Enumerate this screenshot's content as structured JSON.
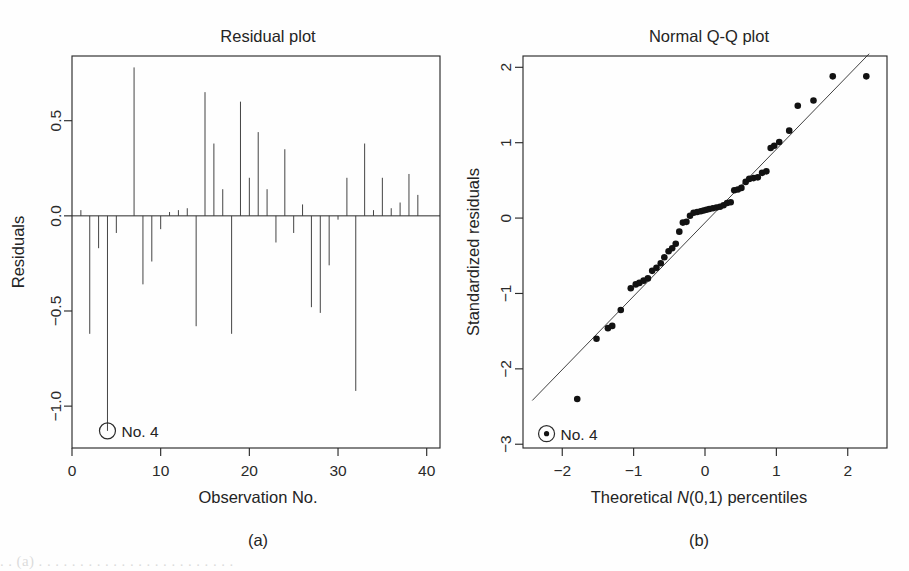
{
  "figure": {
    "panel_a_tag": "(a)",
    "panel_b_tag": "(b)",
    "caption_partial": "     . .   (a)  . . . . . . . . . . . . . . . . . . . . . . . ."
  },
  "chart_data": [
    {
      "id": "residual-plot",
      "type": "bar",
      "title": "Residual plot",
      "xlabel": "Observation No.",
      "ylabel": "Residuals",
      "xlim": [
        0,
        41.5
      ],
      "ylim": [
        -1.22,
        0.84
      ],
      "xticks": [
        0,
        10,
        20,
        30,
        40
      ],
      "xticklabels": [
        "0",
        "10",
        "20",
        "30",
        "40"
      ],
      "yticks": [
        0.5,
        0.0,
        -0.5,
        -1.0
      ],
      "yticklabels": [
        "0.5",
        "0.0",
        "-0.5",
        "-1.0"
      ],
      "grid": false,
      "legend": "none",
      "zero_reference": 0.0,
      "annotation": {
        "text": "No. 4",
        "marker": "open-circle",
        "x": 4,
        "y": -1.13
      },
      "categories": [
        1,
        2,
        3,
        4,
        5,
        6,
        7,
        8,
        9,
        10,
        11,
        12,
        13,
        14,
        15,
        16,
        17,
        18,
        19,
        20,
        21,
        22,
        23,
        24,
        25,
        26,
        27,
        28,
        29,
        30,
        31,
        32,
        33,
        34,
        35,
        36,
        37,
        38,
        39,
        40,
        41
      ],
      "values": [
        0.03,
        -0.62,
        -0.17,
        -1.13,
        -0.09,
        0.0,
        0.78,
        -0.36,
        -0.24,
        -0.07,
        0.02,
        0.03,
        0.04,
        -0.58,
        0.65,
        0.38,
        0.14,
        -0.62,
        0.6,
        0.2,
        0.44,
        0.14,
        -0.14,
        0.35,
        -0.09,
        0.06,
        -0.48,
        -0.51,
        -0.26,
        -0.02,
        0.2,
        -0.92,
        0.38,
        0.03,
        0.2,
        0.04,
        0.07,
        0.22,
        0.11,
        0.0,
        0.0
      ]
    },
    {
      "id": "normal-qq-plot",
      "type": "scatter",
      "title": "Normal Q-Q plot",
      "xlabel": "Theoretical N(0,1) percentiles",
      "xlabel_italic_part": "N",
      "ylabel": "Standardized residuals",
      "xlim": [
        -2.55,
        2.55
      ],
      "ylim": [
        -3.05,
        2.15
      ],
      "xticks": [
        -2,
        -1,
        0,
        1,
        2
      ],
      "xticklabels": [
        "-2",
        "-1",
        "0",
        "1",
        "2"
      ],
      "yticks": [
        2,
        1,
        0,
        -1,
        -2,
        -3
      ],
      "yticklabels": [
        "2",
        "1",
        "0",
        "-1",
        "-2",
        "-3"
      ],
      "grid": false,
      "legend": "none",
      "reference_line": {
        "x": [
          -2.42,
          2.3
        ],
        "y": [
          -2.42,
          2.18
        ]
      },
      "annotation": {
        "text": "No. 4",
        "marker": "filled-circle-in-ring",
        "x": -2.22,
        "y": -2.86
      },
      "points": {
        "x": [
          -1.79,
          -1.52,
          -1.36,
          -1.3,
          -1.18,
          -1.04,
          -0.97,
          -0.92,
          -0.86,
          -0.8,
          -0.74,
          -0.68,
          -0.62,
          -0.57,
          -0.51,
          -0.46,
          -0.41,
          -0.36,
          -0.31,
          -0.26,
          -0.21,
          -0.16,
          -0.11,
          -0.06,
          -0.02,
          0.02,
          0.06,
          0.11,
          0.16,
          0.21,
          0.26,
          0.31,
          0.36,
          0.41,
          0.46,
          0.51,
          0.57,
          0.62,
          0.68,
          0.74,
          0.8,
          0.86,
          0.92,
          0.97,
          1.04,
          1.18,
          1.3,
          1.52,
          1.79,
          2.26
        ],
        "y": [
          -2.4,
          -1.6,
          -1.46,
          -1.43,
          -1.22,
          -0.93,
          -0.88,
          -0.86,
          -0.83,
          -0.8,
          -0.7,
          -0.66,
          -0.6,
          -0.52,
          -0.44,
          -0.4,
          -0.34,
          -0.18,
          -0.06,
          -0.05,
          0.03,
          0.07,
          0.08,
          0.09,
          0.1,
          0.11,
          0.12,
          0.13,
          0.14,
          0.15,
          0.17,
          0.2,
          0.21,
          0.37,
          0.38,
          0.4,
          0.48,
          0.52,
          0.53,
          0.54,
          0.6,
          0.62,
          0.93,
          0.96,
          1.01,
          1.16,
          1.49,
          1.56,
          1.88,
          1.88
        ]
      }
    }
  ]
}
